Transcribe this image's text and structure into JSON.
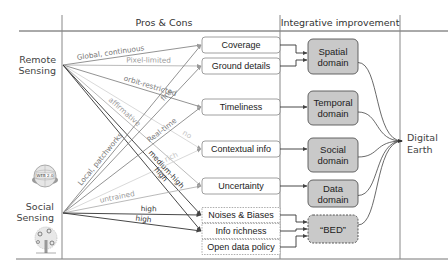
{
  "headers": {
    "pros_cons": "Pros & Cons",
    "integrative": "Integrative improvement"
  },
  "sources": {
    "remote": [
      "Remote",
      "Sensing"
    ],
    "social": [
      "Social",
      "Sensing"
    ],
    "icons": [
      "web2-globe-icon",
      "social-tree-icon"
    ]
  },
  "aspects": [
    {
      "id": "coverage",
      "label": "Coverage",
      "style": "solid"
    },
    {
      "id": "ground",
      "label": "Ground details",
      "style": "solid"
    },
    {
      "id": "timeliness",
      "label": "Timeliness",
      "style": "solid"
    },
    {
      "id": "contextual",
      "label": "Contextual info",
      "style": "solid"
    },
    {
      "id": "uncertainty",
      "label": "Uncertainty",
      "style": "solid"
    },
    {
      "id": "noises",
      "label": "Noises & Biases",
      "style": "dashed"
    },
    {
      "id": "richness",
      "label": "Info richness",
      "style": "dashed"
    },
    {
      "id": "opendata",
      "label": "Open data policy",
      "style": "dashed"
    }
  ],
  "domains": [
    {
      "id": "spatial",
      "label": [
        "Spatial",
        "domain"
      ],
      "style": "solid"
    },
    {
      "id": "temporal",
      "label": [
        "Temporal",
        "domain"
      ],
      "style": "solid"
    },
    {
      "id": "social",
      "label": [
        "Social",
        "domain"
      ],
      "style": "solid"
    },
    {
      "id": "data",
      "label": [
        "Data",
        "domain"
      ],
      "style": "solid"
    },
    {
      "id": "bed",
      "label": [
        "“BED”"
      ],
      "style": "dashed"
    }
  ],
  "target": [
    "Digital",
    "Earth"
  ],
  "edges": [
    {
      "from": "remote",
      "to": "coverage",
      "label": "Global, continuous",
      "tone": "mid"
    },
    {
      "from": "remote",
      "to": "ground",
      "label": "Pixel-limited",
      "tone": "light"
    },
    {
      "from": "remote",
      "to": "timeliness",
      "label": "orbit-restricted",
      "tone": "mid"
    },
    {
      "from": "remote",
      "to": "contextual",
      "label": "no",
      "tone": "faint"
    },
    {
      "from": "remote",
      "to": "uncertainty",
      "label": "affirmative",
      "tone": "light"
    },
    {
      "from": "remote",
      "to": "noises",
      "label": "medium-high",
      "tone": "dark"
    },
    {
      "from": "remote",
      "to": "richness",
      "label": "high",
      "tone": "dark"
    },
    {
      "from": "social",
      "to": "coverage",
      "label": "Local, patchworks",
      "tone": "mid"
    },
    {
      "from": "social",
      "to": "ground",
      "label": "fine",
      "tone": "mid"
    },
    {
      "from": "social",
      "to": "timeliness",
      "label": "Real-time",
      "tone": "mid"
    },
    {
      "from": "social",
      "to": "contextual",
      "label": "rich",
      "tone": "faint"
    },
    {
      "from": "social",
      "to": "uncertainty",
      "label": "untrained",
      "tone": "light"
    },
    {
      "from": "social",
      "to": "noises",
      "label": "high",
      "tone": "dark"
    },
    {
      "from": "social",
      "to": "richness",
      "label": "high",
      "tone": "dark"
    }
  ],
  "domain_links": [
    {
      "from": [
        "coverage",
        "ground"
      ],
      "to": "spatial"
    },
    {
      "from": [
        "timeliness"
      ],
      "to": "temporal"
    },
    {
      "from": [
        "contextual"
      ],
      "to": "social"
    },
    {
      "from": [
        "uncertainty"
      ],
      "to": "data"
    },
    {
      "from": [
        "noises",
        "richness",
        "opendata"
      ],
      "to": "bed"
    }
  ],
  "colors": {
    "domain_fill": "#c9c9c9",
    "box_stroke": "#888888",
    "dark_line": "#333333",
    "mid_line": "#777777",
    "light_line": "#a8a8a8",
    "faint_line": "#cfcfcf"
  }
}
